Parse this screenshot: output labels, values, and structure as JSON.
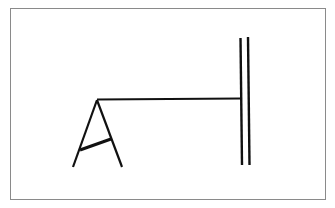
{
  "diagram": {
    "type": "line-drawing",
    "stroke_color": "#111111",
    "frame_color": "#8a8a8a",
    "elements": {
      "a_frame": {
        "apex": [
          97,
          100
        ],
        "left_leg_end": [
          73,
          167
        ],
        "right_leg_end": [
          122,
          167
        ],
        "crossbar": [
          [
            80,
            150
          ],
          [
            111,
            139
          ]
        ]
      },
      "horizontal_line": {
        "from": [
          97,
          99
        ],
        "to": [
          240,
          99
        ]
      },
      "double_bar": {
        "left": {
          "x": 241,
          "y1": 38,
          "y2": 165
        },
        "right": {
          "x": 249,
          "y1": 37,
          "y2": 165
        }
      }
    }
  }
}
